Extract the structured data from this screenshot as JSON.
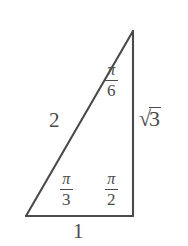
{
  "figure": {
    "kind": "geometry-diagram",
    "stroke_color": "#4a4a4a",
    "background_color": "#ffffff",
    "vertices": {
      "apex": [
        133,
        31
      ],
      "bottom_left": [
        26,
        216
      ],
      "bottom_right": [
        133,
        216
      ]
    }
  },
  "labels": {
    "angle_top": {
      "numerator": "π",
      "denominator": "6"
    },
    "angle_bottom_left": {
      "numerator": "π",
      "denominator": "3"
    },
    "angle_bottom_right": {
      "numerator": "π",
      "denominator": "2"
    },
    "side_hypotenuse": "2",
    "side_vertical_sign": "√",
    "side_vertical_value": "3",
    "side_base": "1"
  }
}
